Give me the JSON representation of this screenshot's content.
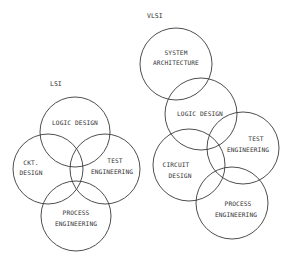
{
  "diagrams": [
    {
      "title": "LSI",
      "circles": [
        {
          "id": "logic",
          "lines": [
            "LOGIC DESIGN"
          ]
        },
        {
          "id": "ckt",
          "lines": [
            "CKT.",
            "DESIGN"
          ]
        },
        {
          "id": "test",
          "lines": [
            "TEST",
            "ENGINEERING"
          ]
        },
        {
          "id": "process",
          "lines": [
            "PROCESS",
            "ENGINEERING"
          ]
        }
      ]
    },
    {
      "title": "VLSI",
      "circles": [
        {
          "id": "system",
          "lines": [
            "SYSTEM",
            "ARCHITECTURE"
          ]
        },
        {
          "id": "logic",
          "lines": [
            "LOGIC DESIGN"
          ]
        },
        {
          "id": "test",
          "lines": [
            "TEST",
            "ENGINEERING"
          ]
        },
        {
          "id": "circuit",
          "lines": [
            "CIRCUIT",
            "DESIGN"
          ]
        },
        {
          "id": "process",
          "lines": [
            "PROCESS",
            "ENGINEERING"
          ]
        }
      ]
    }
  ],
  "colors": {
    "stroke": "#3a3a3a",
    "text": "#333333",
    "background": "#ffffff"
  }
}
